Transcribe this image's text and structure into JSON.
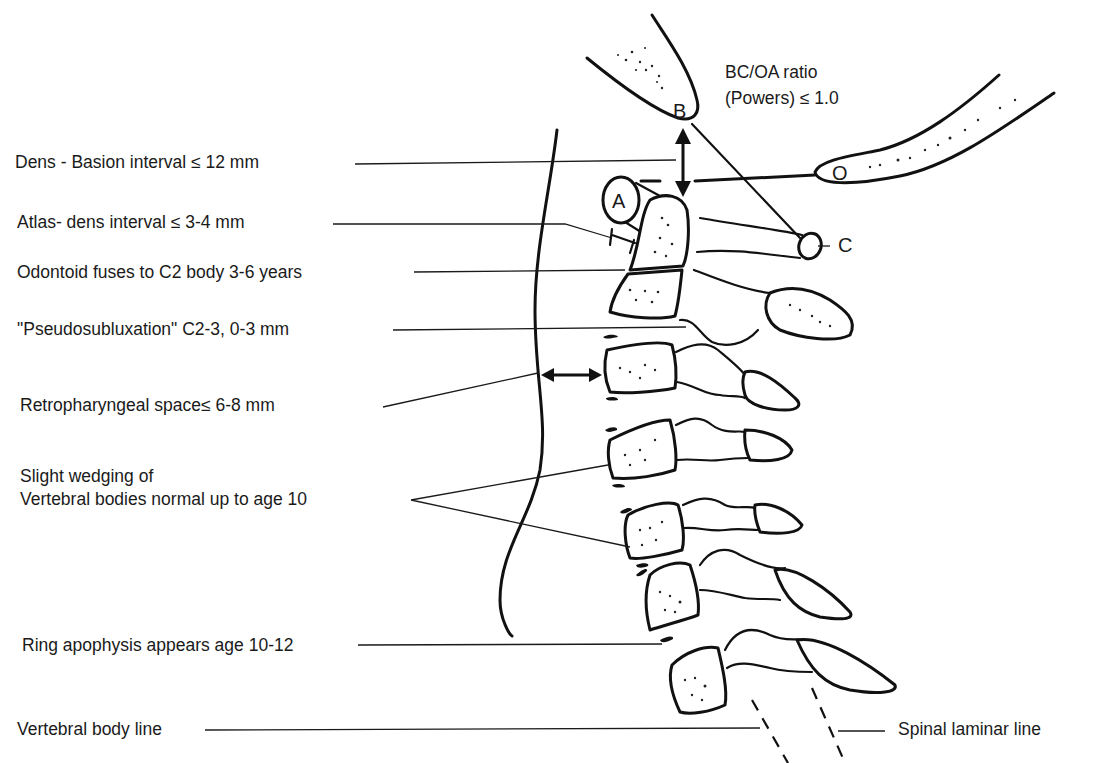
{
  "figure": {
    "labels": {
      "bc_oa_ratio_line1": "BC/OA ratio",
      "bc_oa_ratio_line2": "(Powers) ≤ 1.0",
      "dens_basion": "Dens - Basion interval ≤ 12 mm",
      "atlas_dens": "Atlas- dens interval ≤ 3-4 mm",
      "odontoid_fuses": "Odontoid fuses to C2 body 3-6 years",
      "pseudosubluxation": "\"Pseudosubluxation\" C2-3, 0-3 mm",
      "retropharyngeal": "Retropharyngeal space≤ 6-8 mm",
      "wedging_line1": "Slight wedging of",
      "wedging_line2": "Vertebral bodies normal up to age 10",
      "ring_apophysis": "Ring apophysis appears age 10-12",
      "vertebral_body_line": "Vertebral body line",
      "spinal_laminar_line": "Spinal laminar line"
    },
    "point_letters": {
      "basion": "B",
      "opisthion": "O",
      "atlas_arch": "A",
      "posterior_arch": "C"
    }
  }
}
